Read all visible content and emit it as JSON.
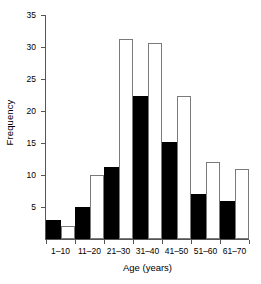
{
  "chart_data": {
    "type": "bar",
    "title": "",
    "subtitle": "",
    "xlabel": "Age (years)",
    "ylabel": "Frequency",
    "categories": [
      "1–10",
      "11–20",
      "21–30",
      "31–40",
      "41–50",
      "51–60",
      "61–70"
    ],
    "series": [
      {
        "name": "black",
        "style": "filled",
        "values": [
          3,
          5,
          11.2,
          22.4,
          15.2,
          7,
          6
        ]
      },
      {
        "name": "white",
        "style": "hollow",
        "values": [
          2,
          10,
          31.2,
          30.6,
          22.3,
          12,
          11
        ]
      }
    ],
    "ylim": [
      0,
      35
    ],
    "yticks": [
      5,
      10,
      15,
      20,
      25,
      30,
      35
    ],
    "ytick_labels": [
      "5",
      "10",
      "15",
      "20",
      "25",
      "30",
      "35"
    ],
    "grid": false,
    "legend": "none",
    "bar_gap": 0,
    "colors": {
      "filled": "#000000",
      "hollow_fill": "#ffffff",
      "hollow_edge": "#7a7a7a",
      "axis": "#555555",
      "text": "#000000",
      "background": "#ffffff"
    }
  }
}
